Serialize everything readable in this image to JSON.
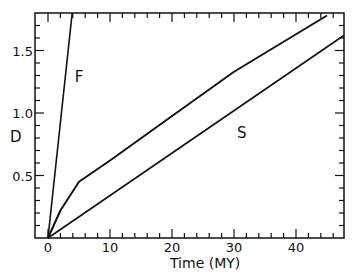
{
  "chart_data": {
    "type": "line",
    "title": "",
    "xlabel": "Time (MY)",
    "ylabel": "D",
    "xlim": [
      -2,
      47.7
    ],
    "ylim": [
      0,
      1.8
    ],
    "x_ticks": [
      0,
      10,
      20,
      30,
      40
    ],
    "x_tick_labels": [
      "0",
      "10",
      "20",
      "30",
      "40"
    ],
    "y_ticks": [
      0.5,
      1.0,
      1.5
    ],
    "y_tick_labels": [
      "0.5",
      "1.0",
      "1.5"
    ],
    "grid": false,
    "legend": "none",
    "series": [
      {
        "name": "F",
        "label": "F",
        "x": [
          0,
          3.9
        ],
        "y": [
          0,
          1.8
        ]
      },
      {
        "name": "curve",
        "label": "",
        "x": [
          0,
          2,
          5,
          10,
          19,
          30,
          45
        ],
        "y": [
          0,
          0.22,
          0.45,
          0.62,
          0.94,
          1.33,
          1.78
        ]
      },
      {
        "name": "S",
        "label": "S",
        "x": [
          0,
          47.7
        ],
        "y": [
          0,
          1.62
        ]
      }
    ],
    "annotations": [
      {
        "text": "F",
        "x": 4.3,
        "y": 1.25
      },
      {
        "text": "S",
        "x": 30.5,
        "y": 0.8
      }
    ]
  },
  "colors": {
    "line": "#111111",
    "background": "#ffffff"
  }
}
